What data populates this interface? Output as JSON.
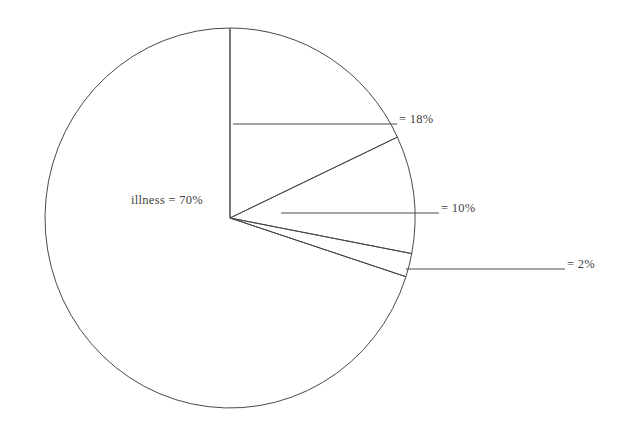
{
  "chart_data": {
    "type": "pie",
    "title": "",
    "subtitle": "",
    "xlabel": "",
    "ylabel": "",
    "legend_position": "none",
    "grid": false,
    "units": "%",
    "start_angle_deg": 0,
    "direction": "clockwise",
    "categories": [
      "illness",
      "",
      "",
      ""
    ],
    "values": [
      70,
      18,
      10,
      2
    ],
    "slices": [
      {
        "name": "illness",
        "label": "illness = 70%",
        "value": 70,
        "start_deg": 108,
        "end_deg": 360,
        "label_placement": "inside",
        "label_x": 131,
        "label_y": 193,
        "has_leader_line": false
      },
      {
        "name": "slice-18",
        "label": "= 18%",
        "value": 18,
        "start_deg": 0,
        "end_deg": 64.8,
        "label_placement": "outside",
        "label_x": 399,
        "label_y": 112,
        "has_leader_line": true,
        "leader_x1": 233,
        "leader_y1": 124,
        "leader_x2": 397,
        "leader_y2": 124
      },
      {
        "name": "slice-10",
        "label": "= 10%",
        "value": 10,
        "start_deg": 64.8,
        "end_deg": 100.8,
        "label_placement": "outside",
        "label_x": 441,
        "label_y": 201,
        "has_leader_line": true,
        "leader_x1": 281,
        "leader_y1": 213,
        "leader_x2": 439,
        "leader_y2": 213
      },
      {
        "name": "slice-2",
        "label": "= 2%",
        "value": 2,
        "start_deg": 100.8,
        "end_deg": 108,
        "label_placement": "outside",
        "label_x": 567,
        "label_y": 257,
        "has_leader_line": true,
        "leader_x1": 406,
        "leader_y1": 269,
        "leader_x2": 565,
        "leader_y2": 269
      }
    ],
    "geometry": {
      "center_x": 230,
      "center_y": 218,
      "radius_x": 185,
      "radius_y": 190
    },
    "style": {
      "stroke_color": "#4a4a4a",
      "fill_color": "#ffffff",
      "background": "#ffffff",
      "text_color": "#3f3f3f"
    }
  }
}
